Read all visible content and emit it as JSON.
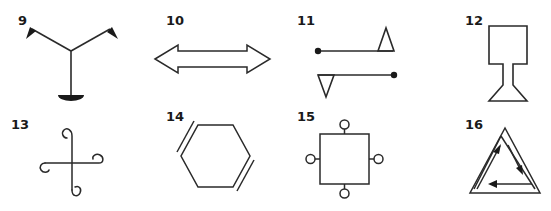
{
  "figures": [
    {
      "number": "9",
      "description": "Y-shaped symbol with two flag ends and a half-disc base"
    },
    {
      "number": "10",
      "description": "Double-headed horizontal hollow arrow"
    },
    {
      "number": "11",
      "description": "Two parallel lines with dot ends and opposing triangles"
    },
    {
      "number": "12",
      "description": "Square on a narrow stem with trapezoid base"
    },
    {
      "number": "13",
      "description": "Cross with curled spiral ends"
    },
    {
      "number": "14",
      "description": "Hexagon with two double-bond sides"
    },
    {
      "number": "15",
      "description": "Square with four small circles on its sides"
    },
    {
      "number": "16",
      "description": "Nested triangles with three directional arrows"
    }
  ],
  "colors": {
    "stroke": "#2a2a2a",
    "background": "#ffffff",
    "label": "#1a1a1a"
  }
}
